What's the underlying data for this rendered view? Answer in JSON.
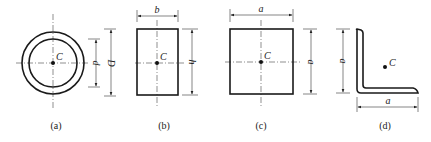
{
  "figures": [
    {
      "id": "a",
      "caption": "(a)",
      "shape": "hollow-circle",
      "centroid_label": "C",
      "dimensions": [
        {
          "label": "d",
          "type": "inner-diameter"
        },
        {
          "label": "D",
          "type": "outer-diameter"
        }
      ]
    },
    {
      "id": "b",
      "caption": "(b)",
      "shape": "rectangle",
      "centroid_label": "C",
      "dimensions": [
        {
          "label": "b",
          "type": "width"
        },
        {
          "label": "h",
          "type": "height"
        }
      ]
    },
    {
      "id": "c",
      "caption": "(c)",
      "shape": "square",
      "centroid_label": "C",
      "dimensions": [
        {
          "label": "a",
          "type": "width"
        },
        {
          "label": "a",
          "type": "height"
        }
      ]
    },
    {
      "id": "d",
      "caption": "(d)",
      "shape": "equal-angle",
      "centroid_label": "C",
      "dimensions": [
        {
          "label": "a",
          "type": "height"
        },
        {
          "label": "a",
          "type": "width"
        }
      ]
    }
  ]
}
